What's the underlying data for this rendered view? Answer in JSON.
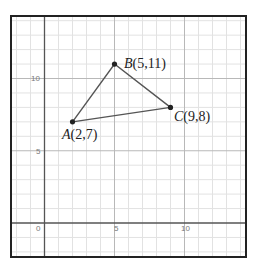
{
  "chart_data": {
    "type": "scatter",
    "title": "",
    "xlabel": "",
    "ylabel": "",
    "xlim": [
      -2.4,
      14.4
    ],
    "ylim": [
      -2.35,
      14.3
    ],
    "grid": true,
    "grid_step": 1,
    "x_ticks": [
      0,
      5,
      10
    ],
    "y_ticks": [
      5,
      10
    ],
    "x_tick_labels": [
      "0",
      "5",
      "10"
    ],
    "y_tick_labels": [
      "5",
      "10"
    ],
    "shape": "triangle",
    "points": [
      {
        "name": "A",
        "x": 2,
        "y": 7,
        "label": "A(2,7)"
      },
      {
        "name": "B",
        "x": 5,
        "y": 11,
        "label": "B(5,11)"
      },
      {
        "name": "C",
        "x": 9,
        "y": 8,
        "label": "C(9,8)"
      }
    ],
    "edges": [
      [
        "A",
        "B"
      ],
      [
        "B",
        "C"
      ],
      [
        "C",
        "A"
      ]
    ],
    "colors": {
      "edge": "#555555",
      "point": "#222222",
      "grid_minor": "#e2e2e2",
      "grid_major": "#b8b8b8",
      "axis": "#555555",
      "frame": "#222222"
    }
  },
  "labels": {
    "tick_x0": "0",
    "tick_x5": "5",
    "tick_x10": "10",
    "tick_y5": "5",
    "tick_y10": "10",
    "A_letter": "A",
    "A_coords": "(2,7)",
    "B_letter": "B",
    "B_coords": "(5,11)",
    "C_letter": "C",
    "C_coords": "(9,8)"
  }
}
